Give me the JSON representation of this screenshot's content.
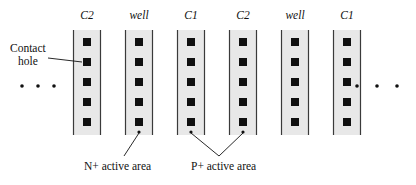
{
  "figure": {
    "type": "ic-layout-cross-section-diagram",
    "background_color": "#ffffff",
    "ink_color": "#111111",
    "column_fill_color": "#e8e8e8",
    "column_edge_color": "#3a3a3a",
    "contact_color": "#101010"
  },
  "columns": [
    {
      "id": "col-1",
      "label": "C2",
      "x": 73,
      "width": 28,
      "top": 30,
      "bottom": 135,
      "contacts": 5
    },
    {
      "id": "col-2",
      "label": "well",
      "x": 125,
      "width": 28,
      "top": 30,
      "bottom": 135,
      "contacts": 5
    },
    {
      "id": "col-3",
      "label": "C1",
      "x": 177,
      "width": 28,
      "top": 30,
      "bottom": 135,
      "contacts": 5
    },
    {
      "id": "col-4",
      "label": "C2",
      "x": 229,
      "width": 28,
      "top": 30,
      "bottom": 135,
      "contacts": 5
    },
    {
      "id": "col-5",
      "label": "well",
      "x": 281,
      "width": 28,
      "top": 30,
      "bottom": 135,
      "contacts": 5
    },
    {
      "id": "col-6",
      "label": "C1",
      "x": 333,
      "width": 28,
      "top": 30,
      "bottom": 135,
      "contacts": 5
    }
  ],
  "contact_rows_y": [
    42,
    62,
    82,
    102,
    122
  ],
  "annotations": {
    "contact_hole": {
      "line1": "Contact",
      "line2": "hole",
      "text_x": 10,
      "text_y": 42
    },
    "n_plus_active_area": {
      "label": "N+ active area",
      "text_x": 84,
      "text_y": 160
    },
    "p_plus_active_area": {
      "label": "P+ active area",
      "text_x": 191,
      "text_y": 160
    }
  },
  "ellipsis": {
    "left": {
      "dots": 3,
      "xs": [
        22,
        38,
        54
      ],
      "y": 86
    },
    "right": {
      "dots": 3,
      "xs": [
        357,
        377,
        397
      ],
      "y": 86
    }
  }
}
